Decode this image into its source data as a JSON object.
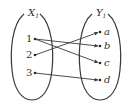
{
  "diagram": {
    "type": "function-mapping",
    "left_set": {
      "name": "X",
      "subscript": "1",
      "elements": [
        "1",
        "2",
        "3"
      ]
    },
    "right_set": {
      "name": "Y",
      "subscript": "1",
      "elements": [
        "a",
        "b",
        "c",
        "d"
      ]
    },
    "mappings": [
      {
        "from": "1",
        "to": "b"
      },
      {
        "from": "1",
        "to": "c"
      },
      {
        "from": "2",
        "to": "a"
      },
      {
        "from": "3",
        "to": "d"
      }
    ],
    "colors": {
      "stroke": "#3a3a3a",
      "text": "#333333",
      "background": "#ffffff"
    }
  }
}
